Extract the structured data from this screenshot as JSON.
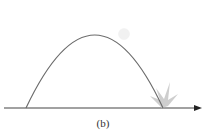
{
  "figure": {
    "caption": "(b)",
    "colors": {
      "trajectory": "#6b6b6b",
      "axis": "#444444",
      "ball": "#f1f1f1",
      "impact": "#c8c8c8"
    },
    "elements": {
      "ground_axis": "horizontal axis with arrow pointing right",
      "trajectory": "parabolic arc",
      "ball": "projectile on descending part of arc",
      "impact": "burst mark at landing point"
    }
  }
}
